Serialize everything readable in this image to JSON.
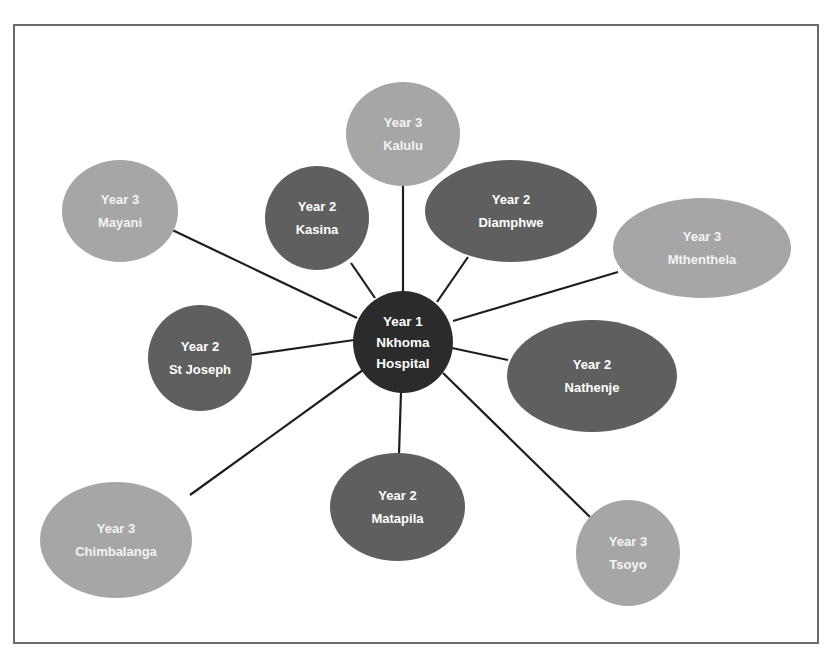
{
  "diagram": {
    "type": "hub-and-spoke",
    "colors": {
      "year1": "#2b2b2b",
      "year2": "#5f5f5f",
      "year3": "#a6a6a6",
      "line": "#1e1e1e",
      "frame": "#6a6a6a"
    },
    "center": {
      "year": "Year 1",
      "name_line1": "Nkhoma",
      "name_line2": "Hospital"
    },
    "nodes": [
      {
        "id": "kalulu",
        "year": "Year 3",
        "name": "Kalulu"
      },
      {
        "id": "mayani",
        "year": "Year 3",
        "name": "Mayani"
      },
      {
        "id": "kasina",
        "year": "Year 2",
        "name": "Kasina"
      },
      {
        "id": "diamphwe",
        "year": "Year 2",
        "name": "Diamphwe"
      },
      {
        "id": "mthenthela",
        "year": "Year 3",
        "name": "Mthenthela"
      },
      {
        "id": "st-joseph",
        "year": "Year 2",
        "name": "St Joseph"
      },
      {
        "id": "nathenje",
        "year": "Year 2",
        "name": "Nathenje"
      },
      {
        "id": "matapila",
        "year": "Year 2",
        "name": "Matapila"
      },
      {
        "id": "chimbalanga",
        "year": "Year 3",
        "name": "Chimbalanga"
      },
      {
        "id": "tsoyo",
        "year": "Year 3",
        "name": "Tsoyo"
      }
    ],
    "edges": [
      [
        "nkhoma-hospital",
        "kalulu"
      ],
      [
        "nkhoma-hospital",
        "mayani"
      ],
      [
        "nkhoma-hospital",
        "kasina"
      ],
      [
        "nkhoma-hospital",
        "diamphwe"
      ],
      [
        "nkhoma-hospital",
        "mthenthela"
      ],
      [
        "nkhoma-hospital",
        "st-joseph"
      ],
      [
        "nkhoma-hospital",
        "nathenje"
      ],
      [
        "nkhoma-hospital",
        "matapila"
      ],
      [
        "nkhoma-hospital",
        "chimbalanga"
      ],
      [
        "nkhoma-hospital",
        "tsoyo"
      ]
    ]
  }
}
